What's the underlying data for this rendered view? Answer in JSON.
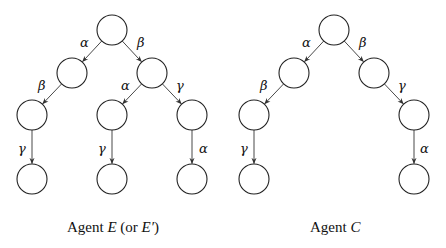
{
  "diagrams": [
    {
      "caption_prefix": "Agent ",
      "caption_var": "E",
      "caption_suffix": " (or ",
      "caption_var2": "E′",
      "caption_end": ")",
      "nodes": [
        {
          "id": "r",
          "x": 112,
          "y": 30
        },
        {
          "id": "a",
          "x": 72,
          "y": 73
        },
        {
          "id": "b",
          "x": 152,
          "y": 73
        },
        {
          "id": "ab",
          "x": 32,
          "y": 115
        },
        {
          "id": "ba",
          "x": 112,
          "y": 115
        },
        {
          "id": "bg",
          "x": 192,
          "y": 115
        },
        {
          "id": "abg",
          "x": 32,
          "y": 179
        },
        {
          "id": "bag",
          "x": 112,
          "y": 179
        },
        {
          "id": "bga",
          "x": 192,
          "y": 179
        }
      ],
      "edges": [
        {
          "from": "r",
          "to": "a",
          "label": "α",
          "lx": 80,
          "ly": 47
        },
        {
          "from": "r",
          "to": "b",
          "label": "β",
          "lx": 137,
          "ly": 47
        },
        {
          "from": "a",
          "to": "ab",
          "label": "β",
          "lx": 38,
          "ly": 90
        },
        {
          "from": "b",
          "to": "ba",
          "label": "α",
          "lx": 121,
          "ly": 90
        },
        {
          "from": "b",
          "to": "bg",
          "label": "γ",
          "lx": 176,
          "ly": 90
        },
        {
          "from": "ab",
          "to": "abg",
          "label": "γ",
          "lx": 18,
          "ly": 153
        },
        {
          "from": "ba",
          "to": "bag",
          "label": "γ",
          "lx": 98,
          "ly": 153
        },
        {
          "from": "bg",
          "to": "bga",
          "label": "α",
          "lx": 199,
          "ly": 153
        }
      ]
    },
    {
      "caption_prefix": "Agent ",
      "caption_var": "C",
      "nodes": [
        {
          "id": "r",
          "x": 334,
          "y": 30
        },
        {
          "id": "a",
          "x": 294,
          "y": 73
        },
        {
          "id": "b",
          "x": 374,
          "y": 73
        },
        {
          "id": "ab",
          "x": 254,
          "y": 115
        },
        {
          "id": "bg",
          "x": 414,
          "y": 115
        },
        {
          "id": "abg",
          "x": 254,
          "y": 179
        },
        {
          "id": "bga",
          "x": 414,
          "y": 179
        }
      ],
      "edges": [
        {
          "from": "r",
          "to": "a",
          "label": "α",
          "lx": 302,
          "ly": 47
        },
        {
          "from": "r",
          "to": "b",
          "label": "β",
          "lx": 359,
          "ly": 47
        },
        {
          "from": "a",
          "to": "ab",
          "label": "β",
          "lx": 260,
          "ly": 90
        },
        {
          "from": "b",
          "to": "bg",
          "label": "γ",
          "lx": 398,
          "ly": 90
        },
        {
          "from": "ab",
          "to": "abg",
          "label": "γ",
          "lx": 240,
          "ly": 153
        },
        {
          "from": "bg",
          "to": "bga",
          "label": "α",
          "lx": 420,
          "ly": 153
        }
      ]
    }
  ],
  "captions": {
    "left": {
      "prefix": "Agent ",
      "var": "E",
      "mid": " (or ",
      "var2": "E′",
      "end": ")"
    },
    "right": {
      "prefix": "Agent ",
      "var": "C"
    }
  },
  "style": {
    "node_radius": 15,
    "stroke": "#222222"
  }
}
